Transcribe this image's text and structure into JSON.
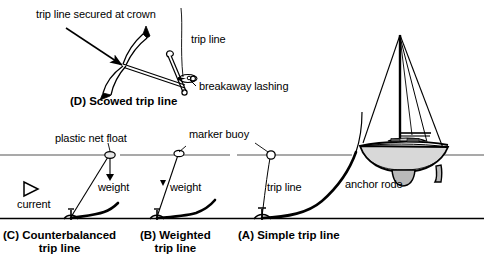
{
  "figure": {
    "background": "#ffffff",
    "ink": "#000000",
    "width": 484,
    "height": 273
  },
  "labels": {
    "crown": "trip line secured at crown",
    "trip_line_top": "trip line",
    "breakaway": "breakaway lashing",
    "plastic_net_float": "plastic net float",
    "marker_buoy": "marker buoy",
    "weight_c": "weight",
    "weight_b": "weight",
    "current": "current",
    "trip_line_a": "trip line",
    "anchor_rode": "anchor rode"
  },
  "captions": {
    "d": {
      "line1": "(D) Scowed trip line",
      "line2": ""
    },
    "c": {
      "line1": "(C) Counterbalanced",
      "line2": "trip line"
    },
    "b": {
      "line1": "(B) Weighted",
      "line2": "trip line"
    },
    "a": {
      "line1": "(A) Simple trip line",
      "line2": ""
    }
  },
  "icons": {
    "current_arrow": "triangle-right-outline",
    "float": "ellipse-float",
    "buoy": "circle-buoy",
    "weight_block": "filled-triangle-weight"
  },
  "scene": {
    "waterline_y": 155,
    "seabed_y": 219,
    "panels": [
      "C",
      "B",
      "A"
    ]
  }
}
